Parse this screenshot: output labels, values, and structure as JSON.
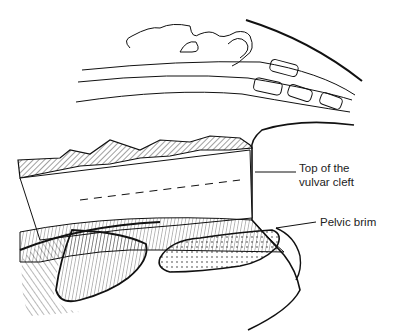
{
  "figure": {
    "labels": [
      {
        "id": "vulvar_cleft",
        "line1": "Top of the",
        "line2": "vulvar cleft"
      },
      {
        "id": "pelvic_brim",
        "text": "Pelvic brim"
      }
    ],
    "colors": {
      "ink": "#111111",
      "background": "#ffffff",
      "label": "#222222"
    }
  }
}
